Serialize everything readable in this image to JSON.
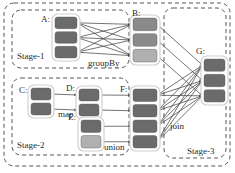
{
  "diagram": {
    "type": "dataflow-dag",
    "colors": {
      "partition_dark": "#6b6b6b",
      "partition_mid": "#8a8a8a",
      "partition_light": "#b0b0b0",
      "node_border": "#d0d0d0",
      "stage_border": "#555555",
      "edge": "#3a3a3a",
      "background": "#ffffff"
    },
    "stages": [
      {
        "id": "stage-1",
        "label": "Stage-1",
        "label_x": 17,
        "label_y": 52,
        "x": 12,
        "y": 10,
        "w": 117,
        "h": 58
      },
      {
        "id": "stage-2",
        "label": "Stage-2",
        "label_x": 17,
        "label_y": 141,
        "x": 12,
        "y": 78,
        "w": 117,
        "h": 77
      },
      {
        "id": "stage-3",
        "label": "Stage-3",
        "label_x": 187,
        "label_y": 147,
        "x": 164,
        "y": 8,
        "w": 62,
        "h": 150
      }
    ],
    "outer": {
      "x": 4,
      "y": 3,
      "w": 226,
      "h": 163
    },
    "nodes": [
      {
        "id": "A",
        "label": "A:",
        "label_x": 41,
        "label_y": 15,
        "x": 52,
        "y": 14,
        "w": 28,
        "h": 47,
        "partitions": [
          "partition_dark",
          "partition_dark",
          "partition_dark"
        ]
      },
      {
        "id": "B",
        "label": "B:",
        "label_x": 132,
        "label_y": 9,
        "x": 130,
        "y": 15,
        "w": 30,
        "h": 50,
        "partitions": [
          "partition_mid",
          "partition_mid",
          "partition_light"
        ]
      },
      {
        "id": "C",
        "label": "C:",
        "label_x": 19,
        "label_y": 86,
        "x": 28,
        "y": 85,
        "w": 26,
        "h": 33,
        "partitions": [
          "partition_dark",
          "partition_dark"
        ]
      },
      {
        "id": "D",
        "label": "D:",
        "label_x": 66,
        "label_y": 84,
        "x": 76,
        "y": 86,
        "w": 26,
        "h": 33,
        "partitions": [
          "partition_dark",
          "partition_dark"
        ]
      },
      {
        "id": "E",
        "label": "E:",
        "label_x": 68,
        "label_y": 113,
        "x": 78,
        "y": 117,
        "w": 26,
        "h": 34,
        "partitions": [
          "partition_dark",
          "partition_light"
        ]
      },
      {
        "id": "F",
        "label": "F:",
        "label_x": 120,
        "label_y": 85,
        "x": 130,
        "y": 86,
        "w": 30,
        "h": 65,
        "partitions": [
          "partition_dark",
          "partition_dark",
          "partition_dark",
          "partition_dark"
        ]
      },
      {
        "id": "G",
        "label": "G:",
        "label_x": 196,
        "label_y": 47,
        "x": 201,
        "y": 56,
        "w": 27,
        "h": 49,
        "partitions": [
          "partition_dark",
          "partition_dark",
          "partition_dark"
        ]
      }
    ],
    "operations": [
      {
        "id": "groupBy",
        "label": "groupBy",
        "x": 88,
        "y": 59
      },
      {
        "id": "map",
        "label": "map",
        "x": 58,
        "y": 110
      },
      {
        "id": "union",
        "label": "union",
        "x": 104,
        "y": 143
      },
      {
        "id": "join",
        "label": "join",
        "x": 170,
        "y": 122
      }
    ],
    "edges": [
      {
        "from": "A",
        "from_partition": 0,
        "to": "B",
        "to_partition": 0
      },
      {
        "from": "A",
        "from_partition": 0,
        "to": "B",
        "to_partition": 1
      },
      {
        "from": "A",
        "from_partition": 0,
        "to": "B",
        "to_partition": 2
      },
      {
        "from": "A",
        "from_partition": 1,
        "to": "B",
        "to_partition": 0
      },
      {
        "from": "A",
        "from_partition": 1,
        "to": "B",
        "to_partition": 1
      },
      {
        "from": "A",
        "from_partition": 1,
        "to": "B",
        "to_partition": 2
      },
      {
        "from": "A",
        "from_partition": 2,
        "to": "B",
        "to_partition": 0
      },
      {
        "from": "A",
        "from_partition": 2,
        "to": "B",
        "to_partition": 1
      },
      {
        "from": "A",
        "from_partition": 2,
        "to": "B",
        "to_partition": 2
      },
      {
        "from": "C",
        "from_partition": 0,
        "to": "D",
        "to_partition": 0
      },
      {
        "from": "C",
        "from_partition": 1,
        "to": "D",
        "to_partition": 1
      },
      {
        "from": "D",
        "from_partition": 0,
        "to": "F",
        "to_partition": 0
      },
      {
        "from": "D",
        "from_partition": 1,
        "to": "F",
        "to_partition": 1
      },
      {
        "from": "E",
        "from_partition": 0,
        "to": "F",
        "to_partition": 2
      },
      {
        "from": "E",
        "from_partition": 1,
        "to": "F",
        "to_partition": 3
      },
      {
        "from": "B",
        "from_partition": 0,
        "to": "G",
        "to_partition": 0
      },
      {
        "from": "B",
        "from_partition": 1,
        "to": "G",
        "to_partition": 1
      },
      {
        "from": "B",
        "from_partition": 2,
        "to": "G",
        "to_partition": 2
      },
      {
        "from": "F",
        "from_partition": 0,
        "to": "G",
        "to_partition": 0
      },
      {
        "from": "F",
        "from_partition": 0,
        "to": "G",
        "to_partition": 1
      },
      {
        "from": "F",
        "from_partition": 0,
        "to": "G",
        "to_partition": 2
      },
      {
        "from": "F",
        "from_partition": 1,
        "to": "G",
        "to_partition": 0
      },
      {
        "from": "F",
        "from_partition": 1,
        "to": "G",
        "to_partition": 1
      },
      {
        "from": "F",
        "from_partition": 1,
        "to": "G",
        "to_partition": 2
      },
      {
        "from": "F",
        "from_partition": 2,
        "to": "G",
        "to_partition": 0
      },
      {
        "from": "F",
        "from_partition": 2,
        "to": "G",
        "to_partition": 1
      },
      {
        "from": "F",
        "from_partition": 2,
        "to": "G",
        "to_partition": 2
      },
      {
        "from": "F",
        "from_partition": 3,
        "to": "G",
        "to_partition": 0
      },
      {
        "from": "F",
        "from_partition": 3,
        "to": "G",
        "to_partition": 1
      },
      {
        "from": "F",
        "from_partition": 3,
        "to": "G",
        "to_partition": 2
      }
    ]
  }
}
